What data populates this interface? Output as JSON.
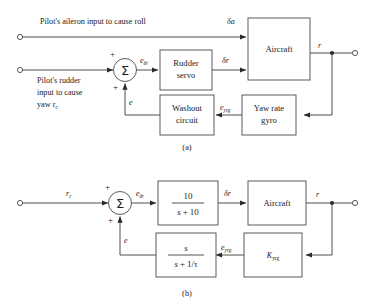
{
  "figure": {
    "captions": {
      "a": "(a)",
      "b": "(b)"
    }
  },
  "diagram_a": {
    "inputs": [
      {
        "id": "aileron",
        "label": "Pilot's aileron input to cause roll",
        "signal": "δa"
      },
      {
        "id": "rudder",
        "label_line1": "Pilot's rudder",
        "label_line2": "input to cause",
        "label_line3": "yaw r",
        "label_line3_sub": "c"
      }
    ],
    "summer": {
      "symbol": "Σ",
      "sign_left": "+",
      "sign_bottom": "+"
    },
    "signals": {
      "e_delta_r": "e",
      "e_delta_r_sub": "δr",
      "delta_a": "δa",
      "delta_r": "δr",
      "r": "r",
      "e": "e",
      "e_yrg": "e",
      "e_yrg_sub": "yrg"
    },
    "blocks": [
      {
        "id": "rudder-servo",
        "line1": "Rudder",
        "line2": "servo"
      },
      {
        "id": "aircraft",
        "line1": "Aircraft",
        "line2": ""
      },
      {
        "id": "yaw-rate-gyro",
        "line1": "Yaw rate",
        "line2": "gyro"
      },
      {
        "id": "washout-circuit",
        "line1": "Washout",
        "line2": "circuit"
      }
    ]
  },
  "diagram_b": {
    "input": {
      "label": "r",
      "label_sub": "c"
    },
    "summer": {
      "symbol": "Σ",
      "sign_left": "+",
      "sign_bottom": "+"
    },
    "signals": {
      "e_delta_r": "e",
      "e_delta_r_sub": "δr",
      "delta_r": "δr",
      "r": "r",
      "e": "e",
      "e_yrg": "e",
      "e_yrg_sub": "yrg"
    },
    "blocks": [
      {
        "id": "rudder-servo-tf",
        "numerator": "10",
        "denominator_s": "s",
        "denominator_plus": "+",
        "denominator_val": "10"
      },
      {
        "id": "aircraft",
        "label": "Aircraft"
      },
      {
        "id": "gain",
        "label": "K",
        "label_sub": "yrg"
      },
      {
        "id": "washout-tf",
        "numerator": "s",
        "denominator_s": "s",
        "denominator_plus": "+",
        "denominator_val": "1/τ"
      }
    ]
  },
  "colors": {
    "line": "#3a3a3a",
    "block_border": "#4a4a4a",
    "text": "#1a1a1a",
    "background": "#ffffff"
  }
}
